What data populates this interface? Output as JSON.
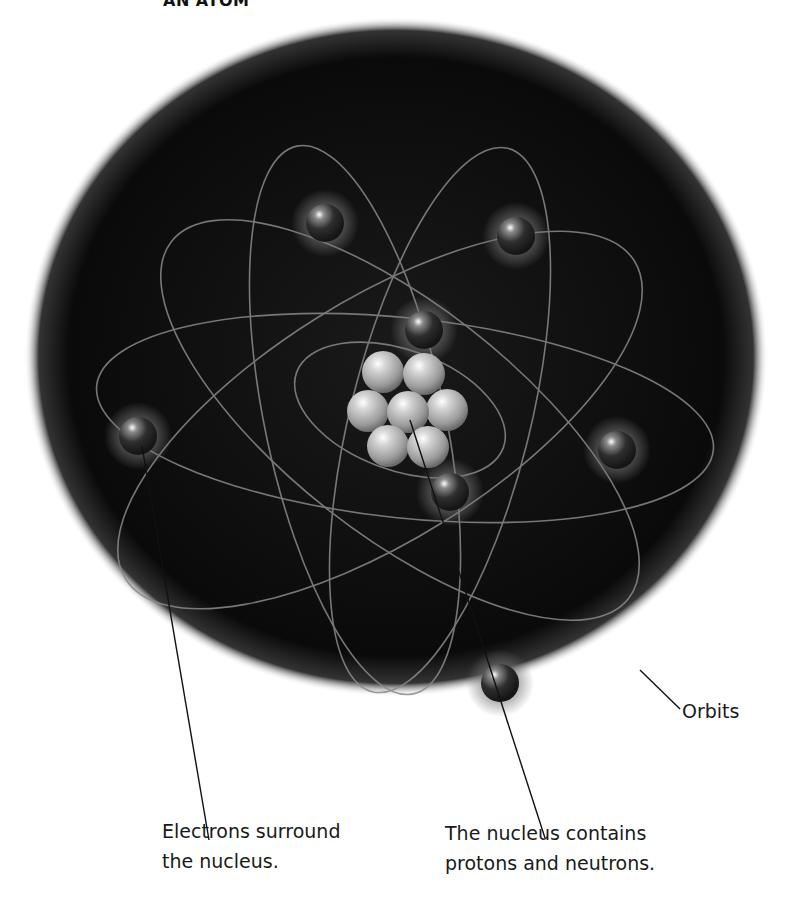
{
  "title": "AN ATOM",
  "labels": {
    "electrons": [
      "Electrons surround",
      "the nucleus."
    ],
    "nucleus": [
      "The nucleus contains",
      "protons and neutrons."
    ],
    "orbits": "Orbits"
  },
  "colors": {
    "sphere_background": "#0b0b0b",
    "orbit_line": "#8a8a8a",
    "proton_neutron": "#bdbdbd",
    "electron": "#2a2a2a",
    "leader_line": "#111111",
    "text": "#1a1a1a"
  },
  "components": {
    "nucleus_particles": 7,
    "electrons": 8,
    "orbits": 6
  }
}
